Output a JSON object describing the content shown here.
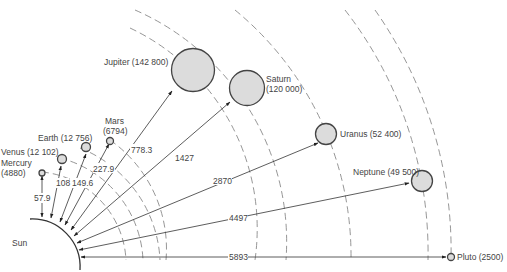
{
  "sun": {
    "label": "Sun"
  },
  "planets": [
    {
      "name": "Mercury",
      "label": "Mercury",
      "diameter_label": "(4880)",
      "distance": "57.9"
    },
    {
      "name": "Venus",
      "label": "Venus (12 102)",
      "distance": "108"
    },
    {
      "name": "Earth",
      "label": "Earth (12 756)",
      "distance": "149.6"
    },
    {
      "name": "Mars",
      "label": "Mars",
      "diameter_label": "(6794)",
      "distance": "227.9"
    },
    {
      "name": "Jupiter",
      "label": "Jupiter (142 800)",
      "distance": "778.3"
    },
    {
      "name": "Saturn",
      "label": "Saturn",
      "diameter_label": "(120 000)",
      "distance": "1427"
    },
    {
      "name": "Uranus",
      "label": "Uranus (52 400)",
      "distance": "2870"
    },
    {
      "name": "Neptune",
      "label": "Neptune (49 500)",
      "distance": "4497"
    },
    {
      "name": "Pluto",
      "label": "Pluto (2500)",
      "distance": "5893"
    }
  ],
  "colors": {
    "planet_fill": "#dcdcdc",
    "stroke": "#444444",
    "orbit": "#8a8a8a",
    "background": "#ffffff"
  }
}
